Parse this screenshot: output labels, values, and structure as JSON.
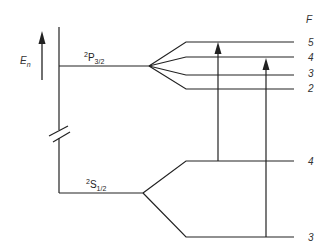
{
  "diagram": {
    "energy_axis_label": "E",
    "energy_axis_subscript": "n",
    "f_column_header": "F",
    "upper_term": {
      "sup": "2",
      "letter": "P",
      "sub": "3/2",
      "hyperfine_levels": [
        "5",
        "4",
        "3",
        "2"
      ]
    },
    "lower_term": {
      "sup": "2",
      "letter": "S",
      "sub": "1/2",
      "hyperfine_levels": [
        "4",
        "3"
      ]
    },
    "transitions": [
      {
        "from": "S1/2 F=4",
        "to": "P3/2 F=5"
      },
      {
        "from": "S1/2 F=3",
        "to": "P3/2 F=4"
      }
    ],
    "line_color": "#222222"
  }
}
